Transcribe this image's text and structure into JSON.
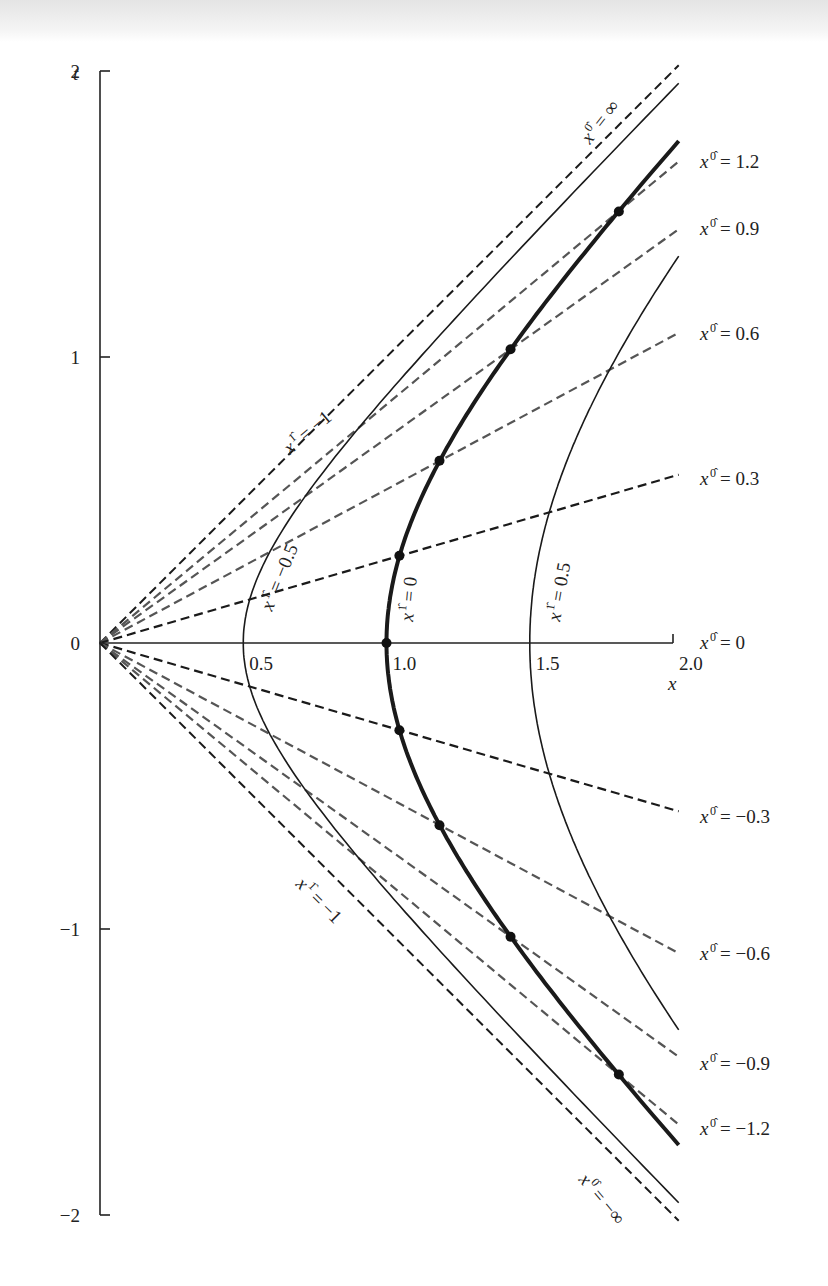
{
  "chart_data": {
    "type": "line",
    "title": "",
    "xlabel": "x",
    "ylabel": "t",
    "xlim": [
      0,
      2.0
    ],
    "ylim": [
      -2,
      2
    ],
    "grid": false,
    "x_ticks": [
      {
        "value": 0.5,
        "label": "0.5"
      },
      {
        "value": 1.0,
        "label": "1.0"
      },
      {
        "value": 1.5,
        "label": "1.5"
      },
      {
        "value": 2.0,
        "label": "2.0"
      }
    ],
    "y_ticks": [
      {
        "value": 2,
        "label": "2"
      },
      {
        "value": 1,
        "label": "1"
      },
      {
        "value": 0,
        "label": "0"
      },
      {
        "value": -1,
        "label": "−1"
      },
      {
        "value": -2,
        "label": "−2"
      }
    ],
    "series_constant_time": {
      "description": "Dashed lines of constant x^0̂ through the origin: t = tanh(x^0̂)·x",
      "lines": [
        {
          "x0hat": "∞",
          "slope": 1.0,
          "color": "#1a1a1a",
          "label": "x^0̂ = ∞",
          "label_pos": "rotated"
        },
        {
          "x0hat": 1.2,
          "slope": 0.8337,
          "color": "#555555",
          "label": "x^0̂ = 1.2"
        },
        {
          "x0hat": 0.9,
          "slope": 0.7163,
          "color": "#555555",
          "label": "x^0̂ = 0.9"
        },
        {
          "x0hat": 0.6,
          "slope": 0.537,
          "color": "#555555",
          "label": "x^0̂ = 0.6"
        },
        {
          "x0hat": 0.3,
          "slope": 0.2913,
          "color": "#1a1a1a",
          "label": "x^0̂ = 0.3"
        },
        {
          "x0hat": 0,
          "slope": 0.0,
          "color": "#1a1a1a",
          "label": "x^0̂ = 0"
        },
        {
          "x0hat": -0.3,
          "slope": -0.2913,
          "color": "#1a1a1a",
          "label": "x^0̂ = −0.3"
        },
        {
          "x0hat": -0.6,
          "slope": -0.537,
          "color": "#555555",
          "label": "x^0̂ = −0.6"
        },
        {
          "x0hat": -0.9,
          "slope": -0.7163,
          "color": "#555555",
          "label": "x^0̂ = −0.9"
        },
        {
          "x0hat": -1.2,
          "slope": -0.8337,
          "color": "#555555",
          "label": "x^0̂ = −1.2"
        },
        {
          "x0hat": "−∞",
          "slope": -1.0,
          "color": "#1a1a1a",
          "label": "x^0̂ = −∞",
          "label_pos": "rotated"
        }
      ]
    },
    "series_constant_space": {
      "description": "Solid hyperbolae of constant x^1̂: x² − t² = (1 + x^1̂)²",
      "curves": [
        {
          "x1hat": -1,
          "a": 0.0,
          "style": "asymptote",
          "label": "x^1̂ = −1"
        },
        {
          "x1hat": -0.5,
          "a": 0.5,
          "style": "thin",
          "label": "x^1̂ = −0.5"
        },
        {
          "x1hat": 0,
          "a": 1.0,
          "style": "bold",
          "label": "x^1̂ = 0"
        },
        {
          "x1hat": 0.5,
          "a": 1.5,
          "style": "thin",
          "label": "x^1̂ = 0.5"
        }
      ]
    },
    "marked_points": {
      "on_curve": "x^1̂ = 0",
      "x0hat_values": [
        -1.2,
        -0.9,
        -0.6,
        -0.3,
        0,
        0.3,
        0.6,
        0.9,
        1.2
      ],
      "points": [
        {
          "x": 1.811,
          "t": -1.509
        },
        {
          "x": 1.433,
          "t": -1.027
        },
        {
          "x": 1.185,
          "t": -0.637
        },
        {
          "x": 1.045,
          "t": -0.305
        },
        {
          "x": 1.0,
          "t": 0.0
        },
        {
          "x": 1.045,
          "t": 0.305
        },
        {
          "x": 1.185,
          "t": 0.637
        },
        {
          "x": 1.433,
          "t": 1.027
        },
        {
          "x": 1.811,
          "t": 1.509
        }
      ]
    }
  },
  "labels": {
    "y_axis": "t",
    "x_axis": "x",
    "x0hat_prefix": "x",
    "x0hat_sup": "0̂",
    "x1hat_sup": "1̂"
  }
}
